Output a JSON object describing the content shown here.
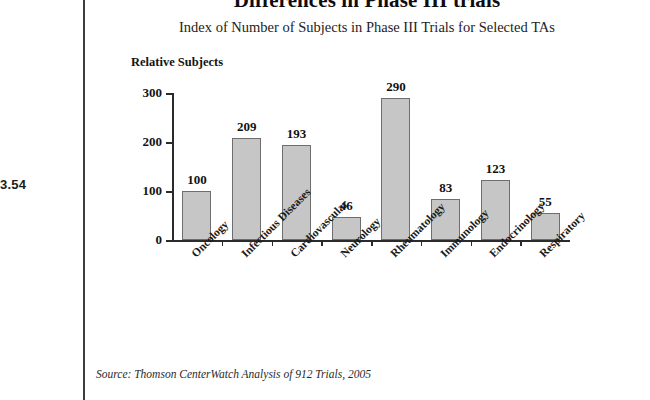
{
  "figure_number": "3.54",
  "chart_data": {
    "type": "bar",
    "title": "Differences in Phase III trials",
    "subtitle": "Index of Number of Subjects in Phase III Trials for Selected TAs",
    "ylabel": "Relative Subjects",
    "xlabel": "",
    "categories": [
      "Oncology",
      "Infectious Diseases",
      "Cardiovascular",
      "Neurology",
      "Rheumatology",
      "Immunology",
      "Endocrinology",
      "Respiratory"
    ],
    "values": [
      100,
      209,
      193,
      46,
      290,
      83,
      123,
      55
    ],
    "yticks": [
      0,
      100,
      200,
      300
    ],
    "ylim": [
      0,
      300
    ],
    "grid": false,
    "legend": "none",
    "bar_color": "#c6c6c6",
    "bar_border_color": "#6e6e6e",
    "axis_color": "#2b2b2b"
  },
  "source_note": "Source: Thomson CenterWatch Analysis of 912 Trials, 2005"
}
